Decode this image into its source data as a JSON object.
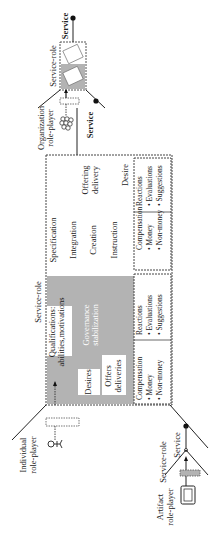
{
  "diagram": {
    "organization": {
      "label_line1": "Organization",
      "label_line2": "role-player",
      "service_role": "Service-role",
      "service_top": "Service",
      "service_bottom": "Service"
    },
    "individual": {
      "label_line1": "Individual",
      "label_line2": "role-player",
      "service_role": "Service-role"
    },
    "artifact": {
      "label_line1": "Artifact",
      "label_line2": "role-player",
      "service_role": "Service-role",
      "service": "Service"
    },
    "gray_region": {
      "qualifications_line1": "Qualifications:",
      "qualifications_line2": "abilities,motivations",
      "desires": "Desires",
      "governance_line1": "Governance",
      "governance_line2": "stabilization",
      "offers_line1": "Offers",
      "offers_line2": "deliveries"
    },
    "white_region": {
      "specification": "Specification",
      "integration": "Integration",
      "creation": "Creation",
      "instruction": "Instruction",
      "offering_line1": "Offering",
      "offering_line2": "delivery",
      "desire": "Desire"
    },
    "bottom_boxes": {
      "left": {
        "compensation": "Compensation",
        "money": "• Money",
        "nonmoney": "• Non-money",
        "reactions": "Reactions",
        "evaluations": "• Evaluations",
        "suggestions": "• Suggestions"
      },
      "right": {
        "compensation": "Compensation",
        "money": "• Money",
        "nonmoney": "• Non-money",
        "reactions": "Reactions",
        "evaluations": "• Evaluations",
        "suggestions": "• Suggestions"
      }
    },
    "colors": {
      "gray_fill": "#b3b3b3",
      "line": "#222222",
      "box_border": "#555555"
    }
  }
}
